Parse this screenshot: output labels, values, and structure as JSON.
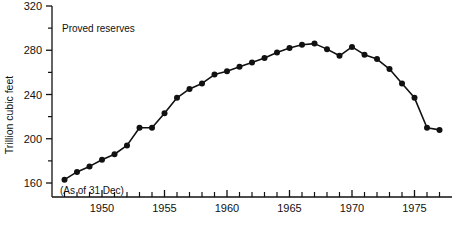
{
  "chart_data": {
    "type": "line",
    "title": "",
    "annotation": "Proved reserves",
    "note": "(As of 31 Dec)",
    "xlabel": "",
    "ylabel": "Trillion cubic feet",
    "xlim": [
      1946,
      1978
    ],
    "ylim": [
      160,
      320
    ],
    "grid": false,
    "legend": "none",
    "y_ticks_major": [
      160,
      200,
      240,
      280,
      320
    ],
    "y_ticks_minor": [
      180,
      220,
      260,
      300
    ],
    "y_tick_labels": [
      "160",
      "200",
      "240",
      "280",
      "320"
    ],
    "x_ticks_major": [
      1950,
      1955,
      1960,
      1965,
      1970,
      1975
    ],
    "x_tick_labels": [
      "1950",
      "1955",
      "1960",
      "1965",
      "1970",
      "1975"
    ],
    "x_tick_step": 1,
    "series": [
      {
        "name": "Proved reserves",
        "x": [
          1947,
          1948,
          1949,
          1950,
          1951,
          1952,
          1953,
          1954,
          1955,
          1956,
          1957,
          1958,
          1959,
          1960,
          1961,
          1962,
          1963,
          1964,
          1965,
          1966,
          1967,
          1968,
          1969,
          1970,
          1971,
          1972,
          1973,
          1974,
          1975,
          1976,
          1977
        ],
        "values": [
          163,
          170,
          175,
          181,
          186,
          194,
          210,
          210,
          223,
          237,
          245,
          250,
          258,
          261,
          265,
          269,
          273,
          278,
          282,
          285,
          286,
          281,
          275,
          283,
          276,
          272,
          263,
          250,
          237,
          210,
          208
        ]
      }
    ]
  },
  "labels": {
    "annotation": "Proved reserves",
    "note": "(As of 31 Dec)",
    "ylabel": "Trillion cubic feet"
  }
}
